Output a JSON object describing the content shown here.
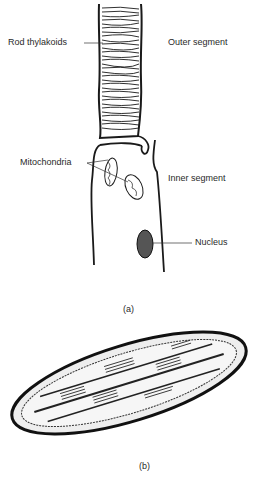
{
  "figure_a": {
    "caption": "(a)",
    "labels": {
      "rod_thylakoids": "Rod thylakoids",
      "outer_segment": "Outer segment",
      "mitochondria": "Mitochondria",
      "inner_segment": "Inner segment",
      "nucleus": "Nucleus"
    }
  },
  "figure_b": {
    "caption": "(b)"
  },
  "colors": {
    "ink": "#1a1a1a",
    "background": "#ffffff"
  }
}
